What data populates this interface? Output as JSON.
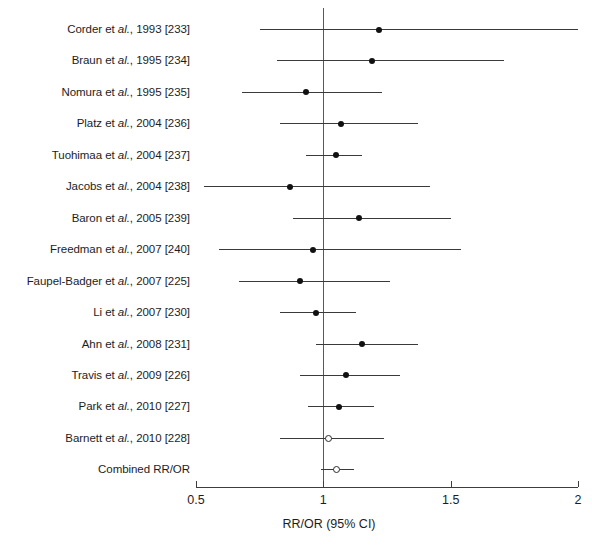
{
  "chart_data": {
    "type": "forest",
    "title": "",
    "xlabel": "RR/OR (95% CI)",
    "ylabel": "",
    "xlim": [
      0.5,
      2.0
    ],
    "xscale": "linear",
    "grid": false,
    "legend": null,
    "reference_line": 1.0,
    "xticks": [
      "0.5",
      "1",
      "1.5",
      "2"
    ],
    "xtick_values": [
      0.5,
      1.0,
      1.5,
      2.0
    ],
    "categories": [
      "Corder et al., 1993 [233]",
      "Braun et al., 1995 [234]",
      "Nomura et al., 1995 [235]",
      "Platz et al., 2004 [236]",
      "Tuohimaa et al., 2004 [237]",
      "Jacobs et al., 2004 [238]",
      "Baron et al., 2005 [239]",
      "Freedman et al., 2007 [240]",
      "Faupel-Badger et al., 2007 [225]",
      "Li et al., 2007 [230]",
      "Ahn et al., 2008 [231]",
      "Travis et al., 2009 [226]",
      "Park et al., 2010 [227]",
      "Barnett et al., 2010 [228]",
      "Combined RR/OR"
    ],
    "rows": [
      {
        "author": "Corder",
        "suffix": " et ",
        "italic": "al.",
        "tail": ", 1993 [233]",
        "estimate": 1.22,
        "ci_low": 0.75,
        "ci_high": 2.0,
        "marker": "filled"
      },
      {
        "author": "Braun",
        "suffix": " et ",
        "italic": "al.",
        "tail": ", 1995 [234]",
        "estimate": 1.19,
        "ci_low": 0.82,
        "ci_high": 1.71,
        "marker": "filled"
      },
      {
        "author": "Nomura",
        "suffix": " et ",
        "italic": "al.",
        "tail": ", 1995 [235]",
        "estimate": 0.93,
        "ci_low": 0.68,
        "ci_high": 1.23,
        "marker": "filled"
      },
      {
        "author": "Platz",
        "suffix": " et ",
        "italic": "al.",
        "tail": ", 2004 [236]",
        "estimate": 1.07,
        "ci_low": 0.83,
        "ci_high": 1.37,
        "marker": "filled"
      },
      {
        "author": "Tuohimaa",
        "suffix": " et ",
        "italic": "al.",
        "tail": ", 2004 [237]",
        "estimate": 1.05,
        "ci_low": 0.93,
        "ci_high": 1.15,
        "marker": "filled"
      },
      {
        "author": "Jacobs",
        "suffix": " et ",
        "italic": "al.",
        "tail": ", 2004 [238]",
        "estimate": 0.87,
        "ci_low": 0.53,
        "ci_high": 1.42,
        "marker": "filled"
      },
      {
        "author": "Baron",
        "suffix": " et ",
        "italic": "al.",
        "tail": ", 2005 [239]",
        "estimate": 1.14,
        "ci_low": 0.88,
        "ci_high": 1.5,
        "marker": "filled"
      },
      {
        "author": "Freedman",
        "suffix": " et ",
        "italic": "al.",
        "tail": ", 2007 [240]",
        "estimate": 0.96,
        "ci_low": 0.59,
        "ci_high": 1.54,
        "marker": "filled"
      },
      {
        "author": "Faupel-Badger",
        "suffix": " et ",
        "italic": "al.",
        "tail": ", 2007 [225]",
        "estimate": 0.91,
        "ci_low": 0.67,
        "ci_high": 1.26,
        "marker": "filled"
      },
      {
        "author": "Li",
        "suffix": " et ",
        "italic": "al.",
        "tail": ", 2007 [230]",
        "estimate": 0.97,
        "ci_low": 0.83,
        "ci_high": 1.13,
        "marker": "filled"
      },
      {
        "author": "Ahn",
        "suffix": " et ",
        "italic": "al.",
        "tail": ", 2008 [231]",
        "estimate": 1.15,
        "ci_low": 0.97,
        "ci_high": 1.37,
        "marker": "filled"
      },
      {
        "author": "Travis",
        "suffix": " et ",
        "italic": "al.",
        "tail": ", 2009 [226]",
        "estimate": 1.09,
        "ci_low": 0.91,
        "ci_high": 1.3,
        "marker": "filled"
      },
      {
        "author": "Park",
        "suffix": " et ",
        "italic": "al.",
        "tail": ", 2010 [227]",
        "estimate": 1.06,
        "ci_low": 0.94,
        "ci_high": 1.2,
        "marker": "filled"
      },
      {
        "author": "Barnett",
        "suffix": " et ",
        "italic": "al.",
        "tail": ", 2010 [228]",
        "estimate": 1.02,
        "ci_low": 0.83,
        "ci_high": 1.24,
        "marker": "open"
      },
      {
        "author": "Combined RR/OR",
        "suffix": "",
        "italic": "",
        "tail": "",
        "estimate": 1.05,
        "ci_low": 0.99,
        "ci_high": 1.12,
        "marker": "open"
      }
    ]
  },
  "axis": {
    "title": "RR/OR (95% CI)",
    "ticks": [
      "0.5",
      "1",
      "1.5",
      "2"
    ]
  },
  "colors": {
    "marker": "#111111",
    "ci": "#3a3a3a",
    "reference": "#555a5e",
    "axis": "#3d3d3d",
    "text": "#1d1d1d",
    "background": "#ffffff"
  }
}
